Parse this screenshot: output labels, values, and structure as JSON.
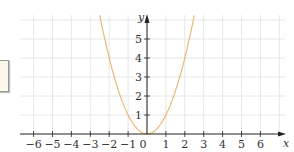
{
  "chart_data": {
    "type": "line",
    "title": "",
    "xlabel": "x",
    "ylabel": "y",
    "function": "y = x^2",
    "xlim": [
      -6.5,
      7
    ],
    "ylim": [
      0,
      6.2
    ],
    "x_ticks": [
      -6,
      -5,
      -4,
      -3,
      -2,
      -1,
      0,
      1,
      2,
      3,
      4,
      5,
      6
    ],
    "y_ticks": [
      1,
      2,
      3,
      4,
      5
    ],
    "x_tick_labels": [
      "−6",
      "−5",
      "−4",
      "−3",
      "−2",
      "−1",
      "0",
      "1",
      "2",
      "3",
      "4",
      "5",
      "6"
    ],
    "y_tick_labels": [
      "1",
      "2",
      "3",
      "4",
      "5"
    ],
    "grid": true,
    "series": [
      {
        "name": "parabola",
        "color": "#e9b36f",
        "x": [
          -2.5,
          -2,
          -1.5,
          -1,
          -0.5,
          0,
          0.5,
          1,
          1.5,
          2,
          2.5
        ],
        "y": [
          6.25,
          4,
          2.25,
          1,
          0.25,
          0,
          0.25,
          1,
          2.25,
          4,
          6.25
        ]
      }
    ]
  },
  "colors": {
    "grid": "#e6e6e6",
    "axis": "#222222",
    "curve": "#e9b36f"
  }
}
